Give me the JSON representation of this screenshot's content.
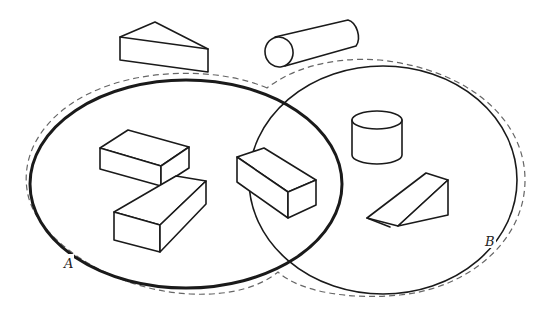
{
  "diagram": {
    "type": "venn",
    "sets": [
      {
        "id": "A",
        "label": "A",
        "contains": [
          "cuboid-1",
          "cuboid-2",
          "cuboid-3"
        ]
      },
      {
        "id": "B",
        "label": "B",
        "contains": [
          "cuboid-3",
          "cylinder-upright",
          "triangular-prism-wedge"
        ]
      }
    ],
    "intersection": [
      "cuboid-3"
    ],
    "outside": [
      "triangular-prism-top",
      "cylinder-lying"
    ],
    "boundary_style": "dashed outer universe outline around both sets",
    "colors": {
      "line": "#1a1a1a",
      "dash": "#666666",
      "background": "#ffffff"
    }
  }
}
